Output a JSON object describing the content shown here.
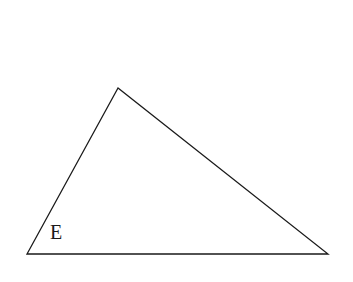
{
  "diagram": {
    "type": "triangle",
    "vertices": {
      "top": [
        118,
        88
      ],
      "bottom_left": [
        27,
        254
      ],
      "bottom_right": [
        328,
        254
      ]
    },
    "angle_label": "E",
    "stroke_color": "#1a1a1a",
    "background": "#ffffff"
  }
}
